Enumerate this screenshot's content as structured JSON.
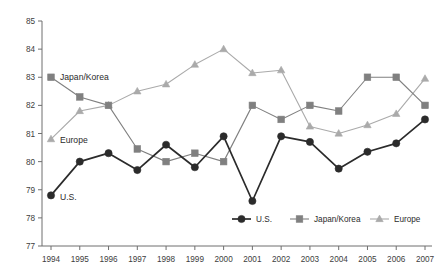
{
  "chart_data": {
    "type": "line",
    "title": "",
    "subtitle": "",
    "xlabel": "",
    "ylabel": "",
    "categories": [
      "1994",
      "1995",
      "1996",
      "1997",
      "1998",
      "1999",
      "2000",
      "2001",
      "2002",
      "2003",
      "2004",
      "2005",
      "2006",
      "2007"
    ],
    "x": [
      1994,
      1995,
      1996,
      1997,
      1998,
      1999,
      2000,
      2001,
      2002,
      2003,
      2004,
      2005,
      2006,
      2007
    ],
    "ylim": [
      77,
      85
    ],
    "yticks": [
      77,
      78,
      79,
      80,
      81,
      82,
      83,
      84,
      85
    ],
    "grid": false,
    "legend_position": "bottom-right",
    "series": [
      {
        "name": "U.S.",
        "color": "#2b2b2b",
        "marker": "circle",
        "values": [
          78.8,
          80.0,
          80.3,
          79.7,
          80.6,
          79.8,
          80.9,
          78.6,
          80.9,
          80.7,
          79.75,
          80.35,
          80.65,
          81.5
        ]
      },
      {
        "name": "Japan/Korea",
        "color": "#808080",
        "marker": "square",
        "values": [
          83.0,
          82.3,
          82.0,
          80.45,
          80.0,
          80.3,
          80.0,
          82.0,
          81.5,
          82.0,
          81.8,
          83.0,
          83.0,
          82.0
        ]
      },
      {
        "name": "Europe",
        "color": "#aaaaaa",
        "marker": "triangle",
        "values": [
          80.8,
          81.8,
          82.0,
          82.5,
          82.75,
          83.45,
          84.0,
          83.15,
          83.25,
          81.25,
          81.0,
          81.3,
          81.7,
          82.95
        ]
      }
    ],
    "annotations": [
      {
        "text": "Japan/Korea",
        "series": "Japan/Korea",
        "at_x": 1994
      },
      {
        "text": "Europe",
        "series": "Europe",
        "at_x": 1994
      },
      {
        "text": "U.S.",
        "series": "U.S.",
        "at_x": 1994
      }
    ]
  },
  "legend": {
    "items": [
      {
        "label": "U.S."
      },
      {
        "label": "Japan/Korea"
      },
      {
        "label": "Europe"
      }
    ]
  },
  "axes": {
    "y_tick_labels": [
      "85",
      "84",
      "83",
      "82",
      "81",
      "80",
      "79",
      "78",
      "77"
    ],
    "x_tick_labels": [
      "1994",
      "1995",
      "1996",
      "1997",
      "1998",
      "1999",
      "2000",
      "2001",
      "2002",
      "2003",
      "2004",
      "2005",
      "2006",
      "2007"
    ]
  },
  "annotation_labels": {
    "japan_korea": "Japan/Korea",
    "europe": "Europe",
    "us": "U.S."
  },
  "colors": {
    "us": "#2b2b2b",
    "japan_korea": "#808080",
    "europe": "#aaaaaa",
    "axis": "#6f6f6f",
    "text": "#2b2b2b",
    "background": "#ffffff"
  }
}
